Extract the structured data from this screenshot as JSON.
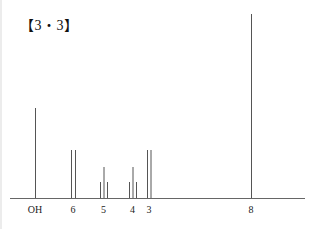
{
  "title": "【3・3】",
  "chart_data": {
    "type": "bar",
    "subtype": "nmr-stick-spectrum",
    "title": "【3・3】",
    "xlabel": "",
    "ylabel": "",
    "grid": false,
    "legend": null,
    "categories": [
      "OH",
      "6",
      "5",
      "4",
      "3",
      "8"
    ],
    "peaks": [
      {
        "label": "OH",
        "multiplicity": "singlet",
        "x_px": [
          35
        ],
        "heights": [
          90
        ]
      },
      {
        "label": "6",
        "multiplicity": "doublet",
        "x_px": [
          71,
          75
        ],
        "heights": [
          48,
          48
        ]
      },
      {
        "label": "5",
        "multiplicity": "triplet",
        "x_px": [
          100,
          103.5,
          107
        ],
        "heights": [
          16,
          31,
          16
        ]
      },
      {
        "label": "4",
        "multiplicity": "triplet",
        "x_px": [
          129,
          132.5,
          136
        ],
        "heights": [
          16,
          31,
          16
        ]
      },
      {
        "label": "3",
        "multiplicity": "doublet",
        "x_px": [
          147,
          150.5
        ],
        "heights": [
          48,
          48
        ]
      },
      {
        "label": "8",
        "multiplicity": "singlet",
        "x_px": [
          251
        ],
        "heights": [
          184
        ]
      }
    ],
    "tick_labels": [
      {
        "text": "OH",
        "x_px": 35
      },
      {
        "text": "6",
        "x_px": 73
      },
      {
        "text": "5",
        "x_px": 103.5
      },
      {
        "text": "4",
        "x_px": 132.5
      },
      {
        "text": "3",
        "x_px": 149
      },
      {
        "text": "8",
        "x_px": 251
      }
    ],
    "baseline_y_px": 198,
    "axis_x_range_px": [
      10,
      305
    ]
  },
  "colors": {
    "line": "#555555",
    "axis": "#666666",
    "text": "#222222"
  }
}
